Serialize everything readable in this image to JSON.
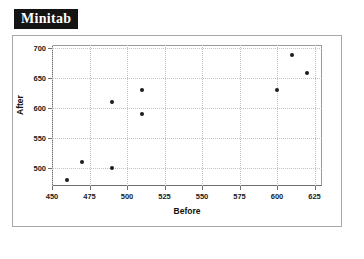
{
  "app": {
    "title": "Minitab"
  },
  "chart_data": {
    "type": "scatter",
    "title": "",
    "xlabel": "Before",
    "ylabel": "After",
    "xlim": [
      450,
      630
    ],
    "ylim": [
      470,
      705
    ],
    "xticks": [
      450,
      475,
      500,
      525,
      550,
      575,
      600,
      625
    ],
    "yticks": [
      500,
      550,
      600,
      650,
      700
    ],
    "grid": true,
    "legend": "none",
    "marker": "filled-circle",
    "marker_color": "#1c1c1c",
    "series": [
      {
        "name": "After vs Before",
        "x": [
          460,
          470,
          490,
          490,
          510,
          510,
          600,
          610,
          620
        ],
        "y": [
          480,
          510,
          500,
          610,
          630,
          590,
          630,
          688,
          658
        ]
      }
    ],
    "points": [
      {
        "x": 460,
        "y": 480
      },
      {
        "x": 470,
        "y": 510
      },
      {
        "x": 490,
        "y": 500
      },
      {
        "x": 490,
        "y": 610
      },
      {
        "x": 510,
        "y": 630
      },
      {
        "x": 510,
        "y": 590
      },
      {
        "x": 600,
        "y": 630
      },
      {
        "x": 610,
        "y": 688
      },
      {
        "x": 620,
        "y": 658
      }
    ]
  }
}
